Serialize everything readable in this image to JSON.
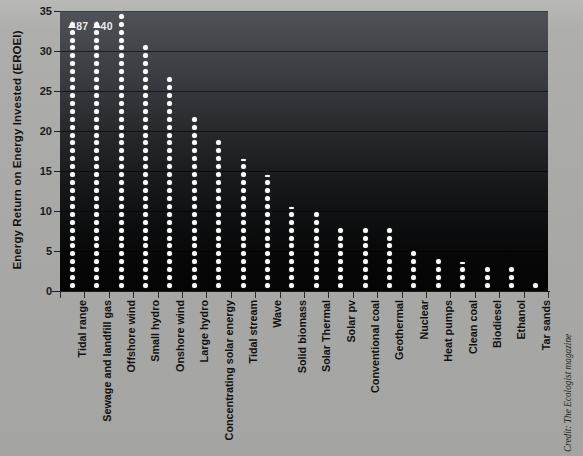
{
  "chart_data": {
    "type": "bar",
    "title": "",
    "subtitle": "",
    "xlabel": "",
    "ylabel": "Energy Return on Energy Invested (EROEI)",
    "ylim": [
      0,
      35
    ],
    "yticks": [
      0,
      5,
      10,
      15,
      20,
      25,
      30,
      35
    ],
    "ytick_labels": [
      "0",
      "5",
      "10",
      "15",
      "20",
      "25",
      "30",
      "35"
    ],
    "grid": true,
    "legend": "none",
    "note": "Each column is drawn as a stack of white dots; one dot equals one EROEI unit. Columns that exceed the 35 axis maximum are capped with an up-arrow and an annotation giving the true value.",
    "categories": [
      "Tidal range",
      "Sewage and landfill gas",
      "Offshore wind",
      "Small hydro",
      "Onshore wind",
      "Large hydro",
      "Concentrating solar energy",
      "Tidal stream",
      "Wave",
      "Solid biomass",
      "Solar Thermal",
      "Solar pv",
      "Conventional coal",
      "Geothermal",
      "Nuclear",
      "Heat pumps",
      "Clean coal",
      "Biodiesel",
      "Ethanol",
      "Tar sands"
    ],
    "values": [
      87,
      40,
      35,
      31,
      27,
      22,
      19,
      16.5,
      14.5,
      10.5,
      10,
      8,
      8,
      8,
      5,
      4,
      3.5,
      3,
      3,
      1
    ],
    "plotted_values": [
      35,
      35,
      35,
      31,
      27,
      22,
      19,
      16.5,
      14.5,
      10.5,
      10,
      8,
      8,
      8,
      5,
      4,
      3.5,
      3,
      3,
      1
    ],
    "capped": [
      true,
      true,
      false,
      false,
      false,
      false,
      false,
      false,
      false,
      false,
      false,
      false,
      false,
      false,
      false,
      false,
      false,
      false,
      false,
      false
    ],
    "annotations": [
      {
        "category": "Tidal range",
        "label": "87"
      },
      {
        "category": "Sewage and landfill gas",
        "label": "40"
      }
    ]
  },
  "credit": {
    "text": "Credit: The Ecologist magazine"
  },
  "colors": {
    "page_background": "#a8a8a6",
    "plot_top": "#4f5257",
    "plot_bottom": "#040404",
    "dot": "#fbfbfb",
    "text": "#141414"
  }
}
